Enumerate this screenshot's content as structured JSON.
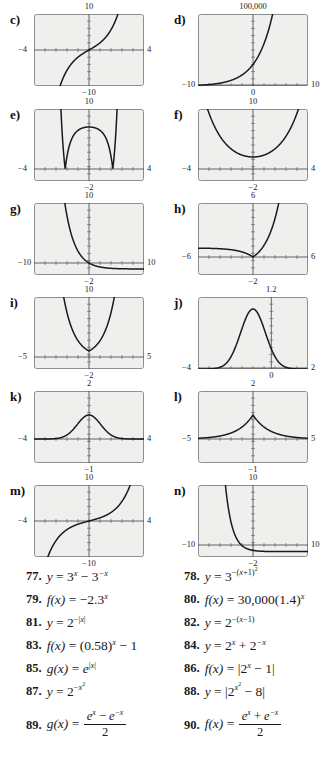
{
  "page": {
    "background": "#ffffff",
    "plot_bg": "#efefee",
    "plot_border": "#8e8e8e",
    "curve_color": "#1a1a1a",
    "axis_color": "#555555"
  },
  "graphs": [
    {
      "key": "c",
      "label": "c)",
      "ymax_label": "10",
      "ymin_label": "−10",
      "xmin_label": "−4",
      "xmax_label": "4",
      "axis_style": "center",
      "xrange": [
        -4,
        4
      ],
      "yrange": [
        -10,
        10
      ],
      "curve": "cubic-odd-sinh",
      "function_hint": "y = 3^x - 3^-x"
    },
    {
      "key": "d",
      "label": "d)",
      "ymax_label": "100,000",
      "ymin_label": "",
      "xmin_label": "−10",
      "xmax_label": "10",
      "xzero_label": "0",
      "axis_style": "bottom",
      "xrange": [
        -10,
        10
      ],
      "yrange": [
        0,
        100000
      ],
      "curve": "exp-growth",
      "function_hint": "f(x) = 30,000(1.4)^x"
    },
    {
      "key": "e",
      "label": "e)",
      "ymax_label": "10",
      "ymin_label": "−2",
      "xmin_label": "−4",
      "xmax_label": "4",
      "axis_style": "center-low",
      "xrange": [
        -4,
        4
      ],
      "yrange": [
        -2,
        10
      ],
      "curve": "abs-2xx-minus8",
      "function_hint": "y = |2^(x^2) - 8|"
    },
    {
      "key": "f",
      "label": "f)",
      "ymax_label": "10",
      "ymin_label": "−2",
      "xmin_label": "−4",
      "xmax_label": "4",
      "axis_style": "center-low",
      "xrange": [
        -4,
        4
      ],
      "yrange": [
        -2,
        10
      ],
      "curve": "cosh-2x",
      "function_hint": "y = 2^x + 2^-x"
    },
    {
      "key": "g",
      "label": "g)",
      "ymax_label": "10",
      "ymin_label": "−2",
      "xmin_label": "−10",
      "xmax_label": "10",
      "axis_style": "center-low",
      "xrange": [
        -10,
        10
      ],
      "yrange": [
        -2,
        10
      ],
      "curve": "exp-decay-shift",
      "function_hint": "f(x) = (0.58)^x - 1"
    },
    {
      "key": "h",
      "label": "h)",
      "ymax_label": "6",
      "ymin_label": "−2",
      "xmin_label": "−6",
      "xmax_label": "6",
      "axis_style": "center-low",
      "xrange": [
        -6,
        6
      ],
      "yrange": [
        -2,
        6
      ],
      "curve": "abs-2x-minus1",
      "function_hint": "f(x) = |2^x - 1|"
    },
    {
      "key": "i",
      "label": "i)",
      "ymax_label": "10",
      "ymin_label": "−2",
      "xmin_label": "−5",
      "xmax_label": "5",
      "axis_style": "center-low",
      "xrange": [
        -5,
        5
      ],
      "yrange": [
        -2,
        10
      ],
      "curve": "e-abs-x",
      "function_hint": "g(x) = e^|x|"
    },
    {
      "key": "j",
      "label": "j)",
      "ymax_label": "1.2",
      "ymin_label": "0",
      "xmin_label": "−4",
      "xmax_label": "2",
      "axis_style": "bottom",
      "xrange": [
        -4,
        2
      ],
      "yrange": [
        0,
        1.2
      ],
      "curve": "gaussian-shift",
      "function_hint": "y = 3^-(x+1)^2"
    },
    {
      "key": "k",
      "label": "k)",
      "ymax_label": "2",
      "ymin_label": "−1",
      "xmin_label": "−4",
      "xmax_label": "4",
      "axis_style": "center-low",
      "xrange": [
        -4,
        4
      ],
      "yrange": [
        -1,
        2
      ],
      "curve": "gaussian-2mx2",
      "function_hint": "y = 2^(-x^2)"
    },
    {
      "key": "l",
      "label": "l)",
      "ymax_label": "2",
      "ymin_label": "−1",
      "xmin_label": "−5",
      "xmax_label": "5",
      "axis_style": "center-low",
      "xrange": [
        -5,
        5
      ],
      "yrange": [
        -1,
        2
      ],
      "curve": "two-pow-neg-absx",
      "function_hint": "y = 2^-|x|"
    },
    {
      "key": "m",
      "label": "m)",
      "ymax_label": "10",
      "ymin_label": "−10",
      "xmin_label": "−4",
      "xmax_label": "4",
      "axis_style": "center",
      "xrange": [
        -4,
        4
      ],
      "yrange": [
        -10,
        10
      ],
      "curve": "sinh-like",
      "function_hint": "g(x) = (e^x - e^-x)/2"
    },
    {
      "key": "n",
      "label": "n)",
      "ymax_label": "10",
      "ymin_label": "−2",
      "xmin_label": "−10",
      "xmax_label": "10",
      "axis_style": "center-low",
      "xrange": [
        -10,
        10
      ],
      "yrange": [
        -2,
        10
      ],
      "curve": "neg-exp-decay",
      "function_hint": "f(x) = -2.3^x reflected"
    }
  ],
  "exercises": [
    {
      "number": "77.",
      "lhs": "y",
      "html": "<span class=\"exmath\">y <span class=\"op\">=</span> <span class=\"num\">3</span><sup>x</sup> <span class=\"op\">−</span> <span class=\"num\">3</span><sup>−x</sup></span>"
    },
    {
      "number": "78.",
      "lhs": "y",
      "html": "<span class=\"exmath\">y <span class=\"op\">=</span> <span class=\"num\">3</span><sup><span class=\"op\">−(</span>x<span class=\"op\">+1)</span><sup><span class=\"op\">2</span></sup></sup></span>"
    },
    {
      "number": "79.",
      "lhs": "f(x)",
      "html": "<span class=\"exmath\">f(x) <span class=\"op\">=</span> <span class=\"op\">−</span><span class=\"num\">2.3</span><sup>x</sup></span>"
    },
    {
      "number": "80.",
      "lhs": "f(x)",
      "html": "<span class=\"exmath\">f(x) <span class=\"op\">=</span> <span class=\"num\">30,000(1.4)</span><sup>x</sup></span>"
    },
    {
      "number": "81.",
      "lhs": "y",
      "html": "<span class=\"exmath\">y <span class=\"op\">=</span> <span class=\"num\">2</span><sup><span class=\"op\">−|</span>x<span class=\"op\">|</span></sup></span>"
    },
    {
      "number": "82.",
      "lhs": "y",
      "html": "<span class=\"exmath\">y <span class=\"op\">=</span> <span class=\"num\">2</span><sup><span class=\"op\">−(</span>x<span class=\"op\">−1)</span></sup></span>"
    },
    {
      "number": "83.",
      "lhs": "f(x)",
      "html": "<span class=\"exmath\">f(x) <span class=\"op\">=</span> <span class=\"num\">(0.58)</span><sup>x</sup> <span class=\"op\">−</span> <span class=\"num\">1</span></span>"
    },
    {
      "number": "84.",
      "lhs": "y",
      "html": "<span class=\"exmath\">y <span class=\"op\">=</span> <span class=\"num\">2</span><sup>x</sup> <span class=\"op\">+</span> <span class=\"num\">2</span><sup>−x</sup></span>"
    },
    {
      "number": "85.",
      "lhs": "g(x)",
      "html": "<span class=\"exmath\">g(x) <span class=\"op\">=</span> e<sup><span class=\"op\">|</span>x<span class=\"op\">|</span></sup></span>"
    },
    {
      "number": "86.",
      "lhs": "f(x)",
      "html": "<span class=\"exmath\">f(x) <span class=\"op\">=</span> <span class=\"abs\">|</span><span class=\"num\">2</span><sup>x</sup> <span class=\"op\">−</span> <span class=\"num\">1</span><span class=\"abs\">|</span></span>"
    },
    {
      "number": "87.",
      "lhs": "y",
      "html": "<span class=\"exmath\">y <span class=\"op\">=</span> <span class=\"num\">2</span><sup><span class=\"op\">−</span>x<sup><span class=\"op\">2</span></sup></sup></span>"
    },
    {
      "number": "88.",
      "lhs": "y",
      "html": "<span class=\"exmath\">y <span class=\"op\">=</span> <span class=\"abs\">|</span><span class=\"num\">2</span><sup>x<sup><span class=\"op\">2</span></sup></sup> <span class=\"op\">−</span> <span class=\"num\">8</span><span class=\"abs\">|</span></span>"
    },
    {
      "number": "89.",
      "lhs": "g(x)",
      "html": "<span class=\"exmath\">g(x) <span class=\"op\">=</span> <span class=\"frac\"><span class=\"nu\">e<sup>x</sup> <span class=\"op\">−</span> e<sup>−x</sup></span><span class=\"bar\"></span><span class=\"de\">2</span></span></span>"
    },
    {
      "number": "90.",
      "lhs": "f(x)",
      "html": "<span class=\"exmath\">f(x) <span class=\"op\">=</span> <span class=\"frac\"><span class=\"nu\">e<sup>x</sup> <span class=\"op\">+</span> e<sup>−x</sup></span><span class=\"bar\"></span><span class=\"de\">2</span></span></span>"
    }
  ]
}
